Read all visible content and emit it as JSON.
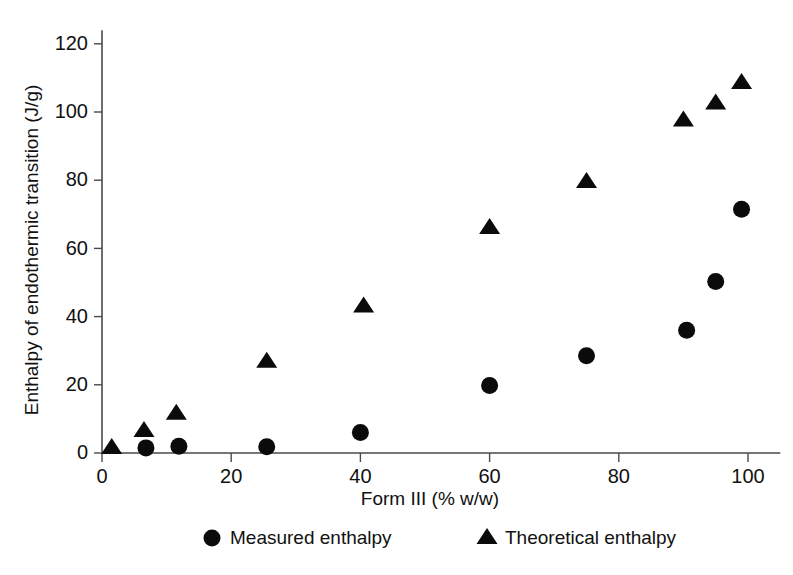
{
  "chart_data": {
    "type": "scatter",
    "title": "",
    "xlabel": "Form III (% w/w)",
    "ylabel": "Enthalpy of endothermic transition (J/g)",
    "xlim": [
      0,
      105
    ],
    "ylim": [
      0,
      124
    ],
    "xticks": [
      0,
      20,
      40,
      60,
      80,
      100
    ],
    "yticks": [
      0,
      20,
      40,
      60,
      80,
      100,
      120
    ],
    "grid": false,
    "legend_position": "bottom",
    "series": [
      {
        "name": "Measured enthalpy",
        "marker": "circle",
        "color": "#0b0b0b",
        "points": [
          {
            "x": 6.8,
            "y": 1.5
          },
          {
            "x": 11.9,
            "y": 2.0
          },
          {
            "x": 25.5,
            "y": 1.8
          },
          {
            "x": 40.0,
            "y": 6.0
          },
          {
            "x": 60.0,
            "y": 19.8
          },
          {
            "x": 75.0,
            "y": 28.5
          },
          {
            "x": 90.5,
            "y": 36.0
          },
          {
            "x": 95.0,
            "y": 50.3
          },
          {
            "x": 99.0,
            "y": 71.5
          }
        ]
      },
      {
        "name": "Theoretical enthalpy",
        "marker": "triangle",
        "color": "#0b0b0b",
        "points": [
          {
            "x": 1.5,
            "y": 1.5
          },
          {
            "x": 6.5,
            "y": 6.5
          },
          {
            "x": 11.5,
            "y": 11.5
          },
          {
            "x": 25.5,
            "y": 26.8
          },
          {
            "x": 40.5,
            "y": 43.0
          },
          {
            "x": 60.0,
            "y": 66.0
          },
          {
            "x": 75.0,
            "y": 79.5
          },
          {
            "x": 90.0,
            "y": 97.5
          },
          {
            "x": 95.0,
            "y": 102.5
          },
          {
            "x": 99.0,
            "y": 108.5
          }
        ]
      }
    ]
  },
  "legend": {
    "items": [
      {
        "label": "Measured enthalpy",
        "marker": "circle-marker-icon"
      },
      {
        "label": "Theoretical enthalpy",
        "marker": "triangle-marker-icon"
      }
    ]
  }
}
